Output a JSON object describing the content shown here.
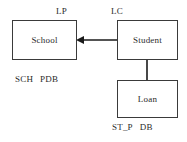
{
  "diagram": {
    "nodes": [
      {
        "id": "school",
        "label": "School"
      },
      {
        "id": "student",
        "label": "Student"
      },
      {
        "id": "loan",
        "label": "Loan"
      }
    ],
    "annotations": [
      {
        "id": "lp",
        "text": "LP"
      },
      {
        "id": "lc",
        "text": "LC"
      }
    ],
    "tags": [
      {
        "id": "school-tag",
        "part1": "SCH",
        "part2": "PDB"
      },
      {
        "id": "loan-tag",
        "part1": "ST_P",
        "part2": "DB"
      }
    ],
    "edges": [
      {
        "id": "student-to-school",
        "from": "student",
        "to": "school",
        "arrow": "left",
        "style": "solid"
      },
      {
        "id": "student-to-loan",
        "from": "student",
        "to": "loan",
        "arrow": "none",
        "style": "solid"
      }
    ],
    "colors": {
      "background": "#ffffff",
      "stroke": "#3a3a3a",
      "text": "#2b2b2b",
      "edge": "#1a1a1a"
    }
  }
}
